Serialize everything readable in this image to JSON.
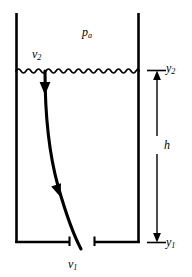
{
  "figure": {
    "type": "physics-diagram",
    "background_color": "#ffffff",
    "line_color": "#000000"
  },
  "labels": {
    "ambient_pressure": {
      "text": "p",
      "subscript": "a"
    },
    "surface_velocity": {
      "text": "v",
      "subscript": "2"
    },
    "exit_velocity": {
      "text": "v",
      "subscript": "1"
    },
    "upper_level": {
      "text": "y",
      "subscript": "2"
    },
    "lower_level": {
      "text": "y",
      "subscript": "1"
    },
    "height_difference": {
      "text": "h",
      "subscript": ""
    }
  },
  "geometry": {
    "tank": {
      "left_wall_x": 16,
      "right_wall_x": 139,
      "top_y": 13,
      "bottom_y": 243,
      "outlet_gap_x_start": 70,
      "outlet_gap_x_end": 94
    },
    "free_surface": {
      "y": 71,
      "x_start": 16,
      "x_end": 139,
      "wave_period": 10,
      "wave_amplitude": 3
    },
    "streamline": {
      "start": [
        45,
        71
      ],
      "end": [
        81,
        249
      ],
      "arrow_positions": [
        [
          45,
          90
        ],
        [
          58,
          192
        ]
      ]
    },
    "dimension_line": {
      "x": 157,
      "top_y": 71,
      "bottom_y": 243,
      "tick_left_x": 148,
      "tick_right_x": 166
    }
  }
}
